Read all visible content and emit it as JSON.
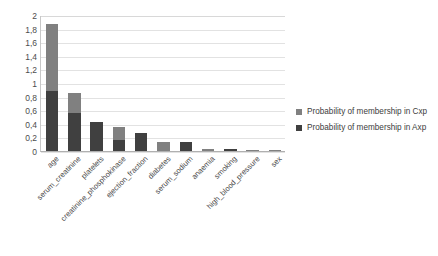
{
  "chart_data": {
    "type": "bar",
    "stacked": true,
    "title": "",
    "xlabel": "",
    "ylabel": "",
    "ylim": [
      0,
      2
    ],
    "grid": true,
    "legend_position": "right",
    "categories": [
      "age",
      "serum_creatinine",
      "platelets",
      "creatinine_phosphokinase",
      "ejection_fraction",
      "diabetes",
      "serum_sodium",
      "anaemia",
      "smoking",
      "high_blood_pressure",
      "sex"
    ],
    "ytick_labels": [
      "0",
      "0,2",
      "0,4",
      "0,6",
      "0,8",
      "1",
      "1,2",
      "1,4",
      "1,6",
      "1,8",
      "2"
    ],
    "ytick_values": [
      0,
      0.2,
      0.4,
      0.6,
      0.8,
      1,
      1.2,
      1.4,
      1.6,
      1.8,
      2
    ],
    "series": [
      {
        "name": "Probability of membership in Axp",
        "key": "Axp",
        "color": "#404040",
        "values": [
          0.88,
          0.56,
          0.43,
          0.16,
          0.27,
          0.0,
          0.13,
          0.0,
          0.03,
          0.0,
          0.0
        ]
      },
      {
        "name": "Probability of membership in Cxp",
        "key": "Cxp",
        "color": "#808080",
        "values": [
          0.99,
          0.29,
          0.0,
          0.19,
          0.0,
          0.13,
          0.0,
          0.03,
          0.0,
          0.02,
          0.02
        ]
      }
    ],
    "totals": [
      1.87,
      0.85,
      0.43,
      0.35,
      0.27,
      0.13,
      0.13,
      0.03,
      0.03,
      0.02,
      0.02
    ]
  },
  "legend": {
    "items": [
      {
        "label": "Probability of membership in Cxp",
        "color": "#808080"
      },
      {
        "label": "Probability of membership in Axp",
        "color": "#404040"
      }
    ]
  }
}
